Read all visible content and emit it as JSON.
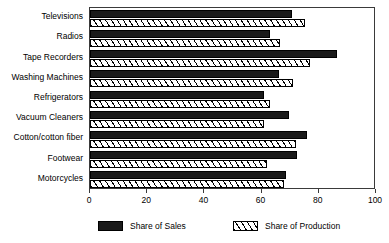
{
  "chart_data": {
    "type": "bar",
    "orientation": "horizontal",
    "title": "",
    "subtitle": "",
    "xlabel": "",
    "ylabel": "",
    "xlim": [
      0,
      100
    ],
    "xticks": [
      0,
      20,
      40,
      60,
      80,
      100
    ],
    "xtick_labels": [
      "0",
      "20",
      "40",
      "60",
      "80",
      "100"
    ],
    "grid": false,
    "legend_position": "bottom",
    "categories": [
      "Televisions",
      "Radios",
      "Tape Recorders",
      "Washing Machines",
      "Refrigerators",
      "Vacuum Cleaners",
      "Cotton/cotton fiber",
      "Footwear",
      "Motorcycles"
    ],
    "series": [
      {
        "name": "Share of Sales",
        "color": "#1a1a1a",
        "pattern": "solid",
        "values": [
          70.5,
          63,
          86.5,
          66,
          61,
          69.5,
          76,
          72.5,
          68.5
        ]
      },
      {
        "name": "Share of Production",
        "color": "#ffffff",
        "pattern": "diagonal-hatch",
        "values": [
          75,
          66.5,
          77,
          71,
          63,
          61,
          72,
          62,
          68
        ]
      }
    ]
  },
  "legend": {
    "items": [
      {
        "label": "Share of Sales",
        "swatch": "solid-black-swatch"
      },
      {
        "label": "Share of Production",
        "swatch": "hatched-swatch"
      }
    ]
  }
}
